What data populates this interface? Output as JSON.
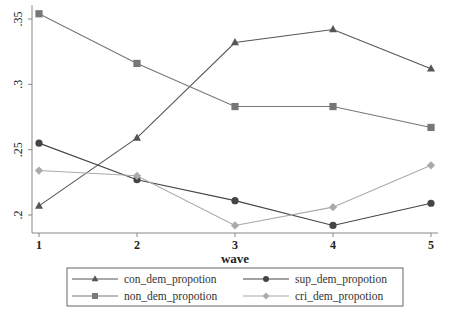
{
  "chart_data": {
    "type": "line",
    "title": "",
    "xlabel": "wave",
    "ylabel": "",
    "x": [
      1,
      2,
      3,
      4,
      5
    ],
    "xticks": [
      "1",
      "2",
      "3",
      "4",
      "5"
    ],
    "yticks": [
      ".2",
      ".25",
      ".3",
      ".35"
    ],
    "ytick_values": [
      0.2,
      0.25,
      0.3,
      0.35
    ],
    "xlim": [
      1,
      5
    ],
    "ylim": [
      0.2,
      0.35
    ],
    "grid": false,
    "legend_position": "bottom",
    "series": [
      {
        "name": "con_dem_propotion",
        "marker": "triangle",
        "color": "#555555",
        "values": [
          0.207,
          0.259,
          0.332,
          0.342,
          0.312
        ]
      },
      {
        "name": "sup_dem_propotion",
        "marker": "circle",
        "color": "#454545",
        "values": [
          0.255,
          0.227,
          0.211,
          0.192,
          0.209
        ]
      },
      {
        "name": "non_dem_propotion",
        "marker": "square",
        "color": "#777777",
        "values": [
          0.354,
          0.316,
          0.283,
          0.283,
          0.267
        ]
      },
      {
        "name": "cri_dem_propotion",
        "marker": "diamond",
        "color": "#aaaaaa",
        "values": [
          0.234,
          0.23,
          0.192,
          0.206,
          0.238
        ]
      }
    ]
  }
}
